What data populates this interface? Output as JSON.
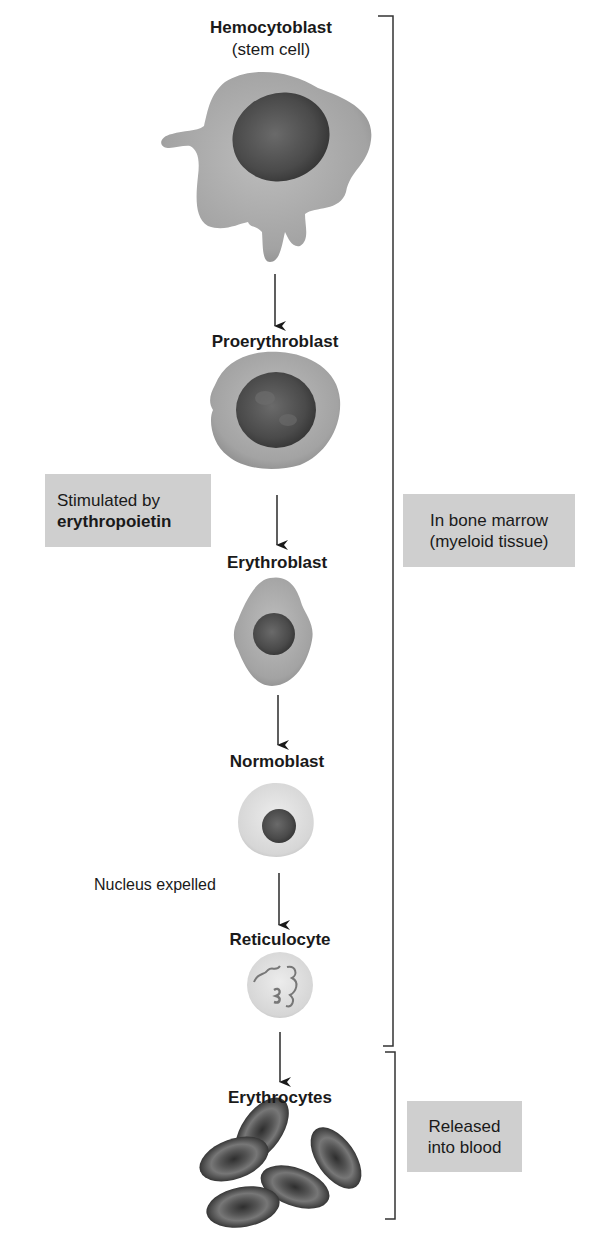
{
  "diagram": {
    "type": "flowchart",
    "stages": [
      {
        "name": "Hemocytoblast",
        "subtitle": "(stem cell)"
      },
      {
        "name": "Proerythroblast"
      },
      {
        "name": "Erythroblast"
      },
      {
        "name": "Normoblast"
      },
      {
        "name": "Reticulocyte"
      },
      {
        "name": "Erythrocytes"
      }
    ],
    "annotations": {
      "stimulus": {
        "line1": "Stimulated by",
        "line2": "erythropoietin"
      },
      "nucleus_note": "Nucleus expelled"
    },
    "brackets": [
      {
        "line1": "In bone marrow",
        "line2": "(myeloid tissue)"
      },
      {
        "line1": "Released",
        "line2": "into blood"
      }
    ],
    "colors": {
      "box_fill": "#cfcfcf",
      "cell_cytoplasm": "#a8a8a8",
      "nucleus": "#4a4a4a",
      "erythrocyte": "#3a3a3a",
      "line": "#333333"
    }
  }
}
